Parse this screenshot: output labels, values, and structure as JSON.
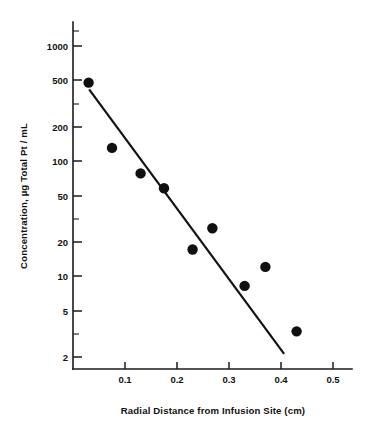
{
  "chart_data": {
    "type": "scatter",
    "title": "",
    "subtitle": "",
    "xlabel": "Radial Distance from Infusion Site  (cm)",
    "ylabel": "Concentration, µg Total Pt / mL",
    "xscale": "linear",
    "yscale": "log",
    "xlim": [
      0.0,
      0.54
    ],
    "ylim": [
      1.5,
      1600
    ],
    "grid": false,
    "legend": null,
    "x_ticks": [
      {
        "value": 0.1,
        "label": "0.1"
      },
      {
        "value": 0.2,
        "label": "0.2"
      },
      {
        "value": 0.3,
        "label": "0.3"
      },
      {
        "value": 0.4,
        "label": "0.4"
      },
      {
        "value": 0.5,
        "label": "0.5"
      }
    ],
    "y_ticks": [
      {
        "value": 1000,
        "label": "1000"
      },
      {
        "value": 500,
        "label": "500"
      },
      {
        "value": 200,
        "label": "200"
      },
      {
        "value": 100,
        "label": "100"
      },
      {
        "value": 50,
        "label": "50"
      },
      {
        "value": 20,
        "label": "20"
      },
      {
        "value": 10,
        "label": "10"
      },
      {
        "value": 5,
        "label": "5"
      },
      {
        "value": 2,
        "label": "2"
      }
    ],
    "y_minor_ticks": [
      2000,
      300,
      30,
      3
    ],
    "series": [
      {
        "name": "Measured concentration",
        "marker": "filled-circle",
        "color": "#101010",
        "x": [
          0.03,
          0.075,
          0.13,
          0.175,
          0.23,
          0.268,
          0.33,
          0.37,
          0.43
        ],
        "y": [
          480,
          130,
          78,
          58,
          17,
          26,
          8.2,
          12,
          3.3
        ]
      },
      {
        "name": "Log-linear regression fit",
        "marker": "line",
        "color": "#121212",
        "x": [
          0.031,
          0.406
        ],
        "y": [
          420,
          2.1
        ]
      }
    ]
  },
  "axis_titles": {
    "x": "Radial Distance from Infusion Site  (cm)",
    "y": "Concentration, µg Total Pt / mL"
  },
  "tick_labels": {
    "y": [
      "1000",
      "500",
      "200",
      "100",
      "50",
      "20",
      "10",
      "5",
      "2"
    ],
    "x": [
      "0.1",
      "0.2",
      "0.3",
      "0.4",
      "0.5"
    ]
  },
  "colors": {
    "marker": "#101010",
    "line": "#121212",
    "axis": "#1b1b1b",
    "background": "#ffffff",
    "text": "#111111"
  }
}
